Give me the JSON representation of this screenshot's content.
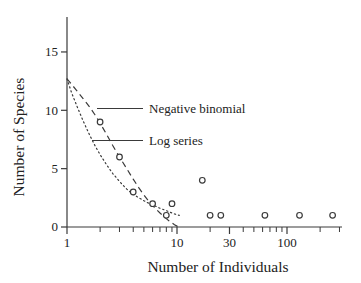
{
  "figure": {
    "background_color": "#ffffff",
    "ink_color": "#3a3a3a",
    "text_color": "#222222"
  },
  "chart_data": {
    "type": "scatter",
    "title": "",
    "xlabel": "Number of Individuals",
    "ylabel": "Number of Species",
    "x_scale": "log",
    "y_scale": "linear",
    "xlim": [
      1,
      316
    ],
    "ylim": [
      0,
      18
    ],
    "grid": false,
    "legend_position": "inline-callouts",
    "x_ticks_labeled": [
      "1",
      "10",
      "30",
      "100"
    ],
    "x_ticks_minor": [
      2,
      3,
      4,
      5,
      6,
      7,
      8,
      9,
      20,
      40,
      50,
      60,
      70,
      80,
      90,
      200,
      300
    ],
    "y_ticks_labeled": [
      "0",
      "5",
      "10",
      "15"
    ],
    "scatter_points": [
      [
        2,
        9
      ],
      [
        3,
        6
      ],
      [
        4,
        3
      ],
      [
        6,
        2
      ],
      [
        8,
        1
      ],
      [
        9,
        2
      ],
      [
        17,
        4
      ],
      [
        20,
        1
      ],
      [
        25,
        1
      ],
      [
        63,
        1
      ],
      [
        130,
        1
      ],
      [
        260,
        1
      ]
    ],
    "series": [
      {
        "name": "Negative binomial",
        "line_style": "dashed",
        "points": [
          [
            1,
            12.7
          ],
          [
            1.2,
            11.8
          ],
          [
            1.4,
            11.0
          ],
          [
            1.6,
            10.3
          ],
          [
            1.8,
            9.6
          ],
          [
            2.0,
            8.9
          ],
          [
            2.3,
            7.9
          ],
          [
            2.6,
            7.0
          ],
          [
            3.0,
            6.0
          ],
          [
            3.5,
            5.0
          ],
          [
            4.0,
            4.1
          ],
          [
            4.5,
            3.35
          ],
          [
            5.0,
            2.75
          ],
          [
            5.5,
            2.25
          ],
          [
            6.0,
            1.85
          ],
          [
            6.5,
            1.5
          ],
          [
            7.0,
            1.2
          ],
          [
            7.5,
            0.95
          ],
          [
            8.0,
            0.72
          ],
          [
            8.5,
            0.52
          ],
          [
            9.0,
            0.35
          ],
          [
            9.5,
            0.2
          ],
          [
            10.0,
            0.08
          ],
          [
            10.4,
            0.0
          ]
        ]
      },
      {
        "name": "Log series",
        "line_style": "dotted",
        "points": [
          [
            1,
            12.7
          ],
          [
            1.1,
            11.5
          ],
          [
            1.25,
            10.2
          ],
          [
            1.4,
            9.1
          ],
          [
            1.6,
            7.9
          ],
          [
            1.8,
            6.95
          ],
          [
            2.0,
            6.2
          ],
          [
            2.3,
            5.3
          ],
          [
            2.6,
            4.6
          ],
          [
            3.0,
            3.9
          ],
          [
            3.5,
            3.25
          ],
          [
            4.0,
            2.8
          ],
          [
            4.5,
            2.5
          ],
          [
            5.0,
            2.25
          ],
          [
            5.5,
            2.05
          ],
          [
            6.0,
            1.9
          ],
          [
            6.5,
            1.75
          ],
          [
            7.0,
            1.6
          ],
          [
            7.5,
            1.5
          ],
          [
            8.0,
            1.4
          ],
          [
            8.5,
            1.3
          ],
          [
            9.0,
            1.2
          ],
          [
            9.5,
            1.12
          ],
          [
            10.0,
            1.05
          ],
          [
            10.5,
            1.0
          ]
        ]
      }
    ]
  }
}
